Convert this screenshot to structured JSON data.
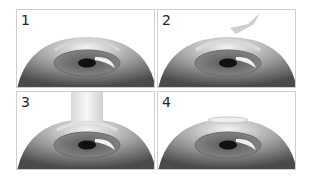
{
  "diagram": {
    "panels": [
      {
        "step": "1",
        "description": "Eye with corneal flap region outlined"
      },
      {
        "step": "2",
        "description": "Instrument approaching cornea"
      },
      {
        "step": "3",
        "description": "Laser beam applied to cornea"
      },
      {
        "step": "4",
        "description": "Flap repositioned on cornea"
      }
    ]
  },
  "colors": {
    "border": "#cfcfcf",
    "eye_dark": "#555555",
    "pupil": "#111111"
  }
}
